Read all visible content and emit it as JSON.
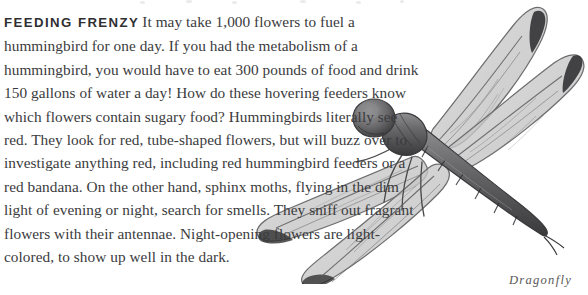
{
  "article": {
    "heading": "FEEDING FRENZY",
    "body": "It may take 1,000 flowers to fuel a hummingbird for one day. If you had the metabolism of a hummingbird, you would have to eat 300 pounds of food and drink 150 gallons of water a day! How do these hovering feeders know which flowers contain sugary food? Hummingbirds literally see red. They look for red, tube-shaped flowers, but will buzz over to investigate anything red, including red hummingbird feeders or a red bandana. On the other hand, sphinx moths, flying in the dim light of evening or night, search for smells. They sniff out fragrant flowers with their antennae. Night-opening flowers are light-colored, to show up well in the dark.",
    "lines": [
      "It may take 1,000 flowers to fuel a hummingbird for",
      "one day. If you had the metabolism of a hummingbird, you would have to eat",
      "300 pounds of food and drink 150 gallons of water a day! How do these",
      "hovering feeders know which flowers contain sugary food? Humming-",
      "birds literally see red. They look for red, tube-shaped flowers,",
      "but will buzz over to investigate anything red, including red",
      "hummingbird feeders or a red bandana. On the other hand,",
      "sphinx moths, flying in the dim light of evening or night,",
      "search for smells. They sniff out fragrant flowers with",
      "their antennae. Night-opening flowers are light-",
      "colored, to show up well in the dark."
    ]
  },
  "figure": {
    "caption": "Dragonfly",
    "style": "grayscale pencil drawing",
    "wing_count": 4
  },
  "colors": {
    "page_background": "#ffffff",
    "body_text": "#3b3b3d",
    "heading_text": "#2f2f31",
    "caption_text": "#585858",
    "illustration_ink": "#4a4a4c",
    "wing_fill": "#c9c9c9"
  }
}
